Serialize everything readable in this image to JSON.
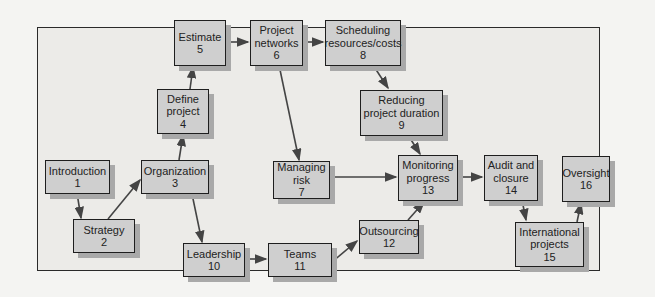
{
  "diagram": {
    "nodes": [
      {
        "id": 1,
        "label": "Introduction",
        "number": "1"
      },
      {
        "id": 2,
        "label": "Strategy",
        "number": "2"
      },
      {
        "id": 3,
        "label": "Organization",
        "number": "3"
      },
      {
        "id": 4,
        "label_lines": [
          "Define",
          "project"
        ],
        "number": "4"
      },
      {
        "id": 5,
        "label": "Estimate",
        "number": "5"
      },
      {
        "id": 6,
        "label_lines": [
          "Project",
          "networks"
        ],
        "number": "6"
      },
      {
        "id": 7,
        "label_lines": [
          "Managing",
          "risk"
        ],
        "number": "7"
      },
      {
        "id": 8,
        "label_lines": [
          "Scheduling",
          "resources/costs"
        ],
        "number": "8"
      },
      {
        "id": 9,
        "label_lines": [
          "Reducing",
          "project duration"
        ],
        "number": "9"
      },
      {
        "id": 10,
        "label": "Leadership",
        "number": "10"
      },
      {
        "id": 11,
        "label": "Teams",
        "number": "11"
      },
      {
        "id": 12,
        "label": "Outsourcing",
        "number": "12"
      },
      {
        "id": 13,
        "label_lines": [
          "Monitoring",
          "progress"
        ],
        "number": "13"
      },
      {
        "id": 14,
        "label_lines": [
          "Audit and",
          "closure"
        ],
        "number": "14"
      },
      {
        "id": 15,
        "label_lines": [
          "International",
          "projects"
        ],
        "number": "15"
      },
      {
        "id": 16,
        "label": "Oversight",
        "number": "16"
      }
    ],
    "edges": [
      [
        "1",
        "2"
      ],
      [
        "2",
        "3"
      ],
      [
        "3",
        "4"
      ],
      [
        "4",
        "5"
      ],
      [
        "5",
        "6"
      ],
      [
        "6",
        "8"
      ],
      [
        "8",
        "9"
      ],
      [
        "9",
        "13"
      ],
      [
        "6",
        "7"
      ],
      [
        "7",
        "13"
      ],
      [
        "3",
        "10"
      ],
      [
        "10",
        "11"
      ],
      [
        "11",
        "12"
      ],
      [
        "12",
        "13"
      ],
      [
        "13",
        "14"
      ],
      [
        "14",
        "15"
      ],
      [
        "15",
        "16"
      ]
    ],
    "colors": {
      "box": "#cfcfcf",
      "shadow": "#a9a9a9",
      "border": "#1e1e1e",
      "arrow": "#444444",
      "frame": "#2a2a2a"
    }
  }
}
